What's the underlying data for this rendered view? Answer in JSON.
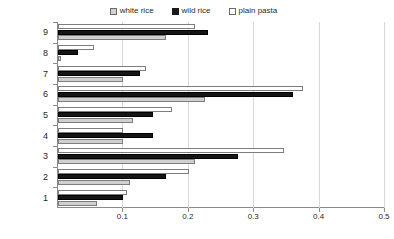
{
  "chart_data": {
    "type": "bar",
    "orientation": "horizontal",
    "title": "",
    "xlabel": "",
    "ylabel": "",
    "xlim": [
      0,
      0.5
    ],
    "xticks": [
      "0.1",
      "0.2",
      "0.3",
      "0.4",
      "0.5"
    ],
    "xtick_values": [
      0.1,
      0.2,
      0.3,
      0.4,
      0.5
    ],
    "grid": true,
    "legend_position": "top-center",
    "categories": [
      "1",
      "2",
      "3",
      "4",
      "5",
      "6",
      "7",
      "8",
      "9"
    ],
    "series": [
      {
        "name": "white rice",
        "swatch": "white-rice",
        "color": "#d0d0d0",
        "values": [
          0.06,
          0.11,
          0.21,
          0.1,
          0.115,
          0.225,
          0.1,
          0.005,
          0.165
        ]
      },
      {
        "name": "wild rice",
        "swatch": "wild-rice",
        "color": "#151515",
        "values": [
          0.1,
          0.165,
          0.275,
          0.145,
          0.145,
          0.36,
          0.125,
          0.03,
          0.23
        ]
      },
      {
        "name": "plain pasta",
        "swatch": "plain-pasta",
        "color": "#ffffff",
        "values": [
          0.105,
          0.2,
          0.345,
          0.1,
          0.175,
          0.375,
          0.135,
          0.055,
          0.21
        ]
      }
    ]
  }
}
